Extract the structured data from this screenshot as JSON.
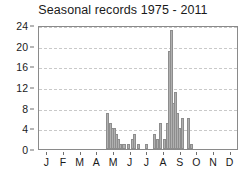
{
  "chart_data": {
    "type": "bar",
    "title": "Seasonal records 1975 - 2011",
    "xlabel": "",
    "ylabel": "",
    "ylim": [
      0,
      24
    ],
    "yticks": [
      0,
      4,
      8,
      12,
      16,
      20,
      24
    ],
    "grid": true,
    "legend": null,
    "xtick_labels": [
      "J",
      "F",
      "M",
      "A",
      "M",
      "J",
      "J",
      "A",
      "S",
      "O",
      "N",
      "D"
    ],
    "xtick_label_full": [
      "January",
      "February",
      "March",
      "April",
      "May",
      "June",
      "July",
      "August",
      "September",
      "October",
      "November",
      "December"
    ],
    "bar_color": "#b0b0b0",
    "bar_edge_color": "#8d8d8d",
    "note": "Daily/pentad bar series spanning approximately May through early November; zero counts January-April and late November-December.",
    "x_positions": [
      4.62,
      4.78,
      4.94,
      5.1,
      5.26,
      5.42,
      5.58,
      5.74,
      5.9,
      6.22,
      6.38,
      6.54,
      6.7,
      6.86,
      7.18,
      7.34,
      7.5,
      7.66,
      7.98,
      8.14,
      8.3,
      8.46,
      8.62,
      8.78,
      8.94,
      9.1,
      9.26,
      9.42,
      9.58,
      9.74,
      9.9,
      10.22,
      10.38,
      10.54,
      10.7,
      11.02
    ],
    "values": [
      7,
      0,
      5,
      4,
      4,
      3,
      2,
      1,
      1,
      1,
      2,
      3,
      1,
      1,
      0,
      1,
      0,
      0,
      3,
      5,
      2,
      5,
      19,
      23,
      9,
      11,
      7,
      4,
      6,
      0,
      6,
      1,
      0,
      0,
      0,
      0
    ],
    "series_points": [
      {
        "x": 4.62,
        "y": 7
      },
      {
        "x": 4.78,
        "y": 5
      },
      {
        "x": 4.9,
        "y": 4
      },
      {
        "x": 5.02,
        "y": 4
      },
      {
        "x": 5.14,
        "y": 3
      },
      {
        "x": 5.26,
        "y": 2
      },
      {
        "x": 5.38,
        "y": 1
      },
      {
        "x": 5.6,
        "y": 1
      },
      {
        "x": 5.86,
        "y": 1
      },
      {
        "x": 6.1,
        "y": 2
      },
      {
        "x": 6.22,
        "y": 3
      },
      {
        "x": 6.46,
        "y": 1
      },
      {
        "x": 6.94,
        "y": 1
      },
      {
        "x": 7.42,
        "y": 3
      },
      {
        "x": 7.6,
        "y": 2
      },
      {
        "x": 7.78,
        "y": 5
      },
      {
        "x": 8.02,
        "y": 2
      },
      {
        "x": 8.2,
        "y": 5
      },
      {
        "x": 8.32,
        "y": 19
      },
      {
        "x": 8.44,
        "y": 23
      },
      {
        "x": 8.56,
        "y": 9
      },
      {
        "x": 8.68,
        "y": 11
      },
      {
        "x": 8.8,
        "y": 7
      },
      {
        "x": 8.92,
        "y": 4
      },
      {
        "x": 9.1,
        "y": 6
      },
      {
        "x": 9.46,
        "y": 6
      },
      {
        "x": 9.64,
        "y": 1
      }
    ],
    "max_value": 23,
    "max_value_month": "September"
  }
}
